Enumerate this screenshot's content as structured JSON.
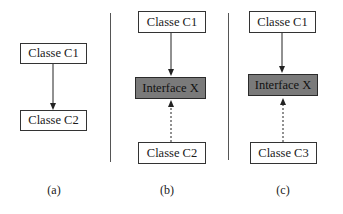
{
  "panels": [
    {
      "id": "a",
      "caption": "(a)",
      "boxes": [
        {
          "label": "Classe C1",
          "kind": "class"
        },
        {
          "label": "Classe C2",
          "kind": "class"
        }
      ],
      "edges": [
        {
          "from": "Classe C1",
          "to": "Classe C2",
          "style": "solid"
        }
      ]
    },
    {
      "id": "b",
      "caption": "(b)",
      "boxes": [
        {
          "label": "Classe C1",
          "kind": "class"
        },
        {
          "label": "Interface X",
          "kind": "interface"
        },
        {
          "label": "Classe C2",
          "kind": "class"
        }
      ],
      "edges": [
        {
          "from": "Classe C1",
          "to": "Interface X",
          "style": "solid"
        },
        {
          "from": "Classe C2",
          "to": "Interface X",
          "style": "dashed"
        }
      ]
    },
    {
      "id": "c",
      "caption": "(c)",
      "boxes": [
        {
          "label": "Classe C1",
          "kind": "class"
        },
        {
          "label": "Interface X",
          "kind": "interface"
        },
        {
          "label": "Classe C3",
          "kind": "class"
        }
      ],
      "edges": [
        {
          "from": "Classe C1",
          "to": "Interface X",
          "style": "solid"
        },
        {
          "from": "Classe C3",
          "to": "Interface X",
          "style": "dashed"
        }
      ]
    }
  ],
  "colors": {
    "interface_fill": "#7a7a7a",
    "border": "#333333",
    "divider": "#555555"
  }
}
